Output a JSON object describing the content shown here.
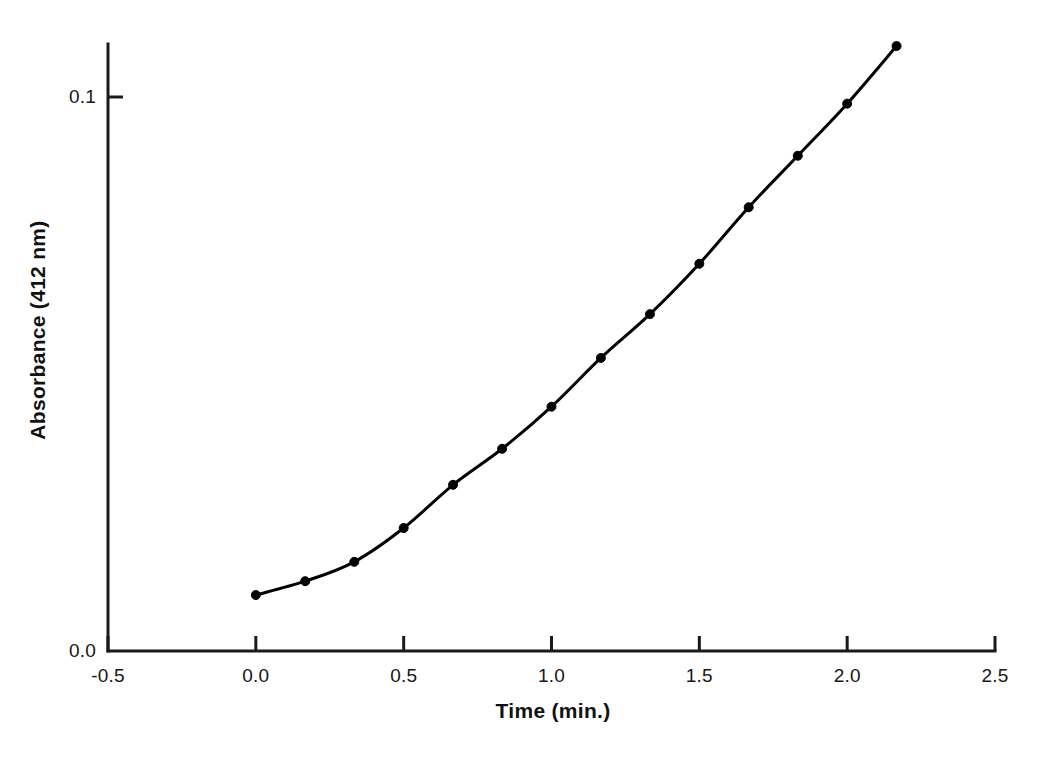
{
  "chart_data": {
    "type": "line",
    "title": "",
    "subtitle": "",
    "xlabel": "Time (min.)",
    "ylabel": "Absorbance (412 nm)",
    "xlim": [
      -0.5,
      2.5
    ],
    "ylim": [
      0.0,
      0.1155
    ],
    "xticks": [
      -0.5,
      0.0,
      0.5,
      1.0,
      1.5,
      2.0,
      2.5
    ],
    "xtick_labels": [
      "-0.5",
      "0.0",
      "0.5",
      "1.0",
      "1.5",
      "2.0",
      "2.5"
    ],
    "yticks": [
      0.0,
      0.1
    ],
    "ytick_labels": [
      "0.0",
      "0.1"
    ],
    "grid": false,
    "legend": null,
    "annotations": [],
    "series": [
      {
        "name": "Absorbance vs Time",
        "marker": "filled-circle",
        "marker_size": 9,
        "line_width": 3,
        "color": "#000000",
        "x": [
          0.0,
          0.167,
          0.333,
          0.5,
          0.667,
          0.833,
          1.0,
          1.167,
          1.333,
          1.5,
          1.667,
          1.833,
          2.0,
          2.167
        ],
        "y": [
          0.0101,
          0.0126,
          0.0161,
          0.0222,
          0.03,
          0.0365,
          0.0441,
          0.0529,
          0.0608,
          0.0699,
          0.0801,
          0.0894,
          0.0988,
          0.1092
        ]
      }
    ]
  },
  "axes": {
    "x_axis_name": "time-axis",
    "y_axis_name": "absorbance-axis",
    "axis_color": "#1a1a1a",
    "axis_width": 3
  }
}
